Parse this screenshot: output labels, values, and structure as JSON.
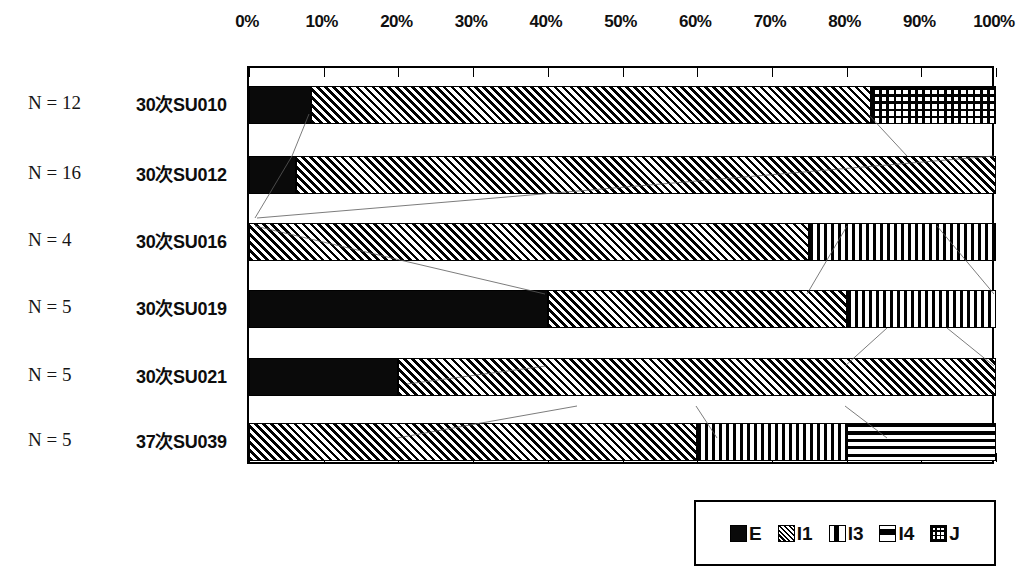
{
  "chart_data": {
    "type": "bar",
    "orientation": "horizontal",
    "stacked": true,
    "normalized_percent": true,
    "title": "",
    "xlabel": "",
    "ylabel": "",
    "xlim": [
      0,
      100
    ],
    "grid": false,
    "tick_labels": [
      "0%",
      "10%",
      "20%",
      "30%",
      "40%",
      "50%",
      "60%",
      "70%",
      "80%",
      "90%",
      "100%"
    ],
    "tick_values": [
      0,
      10,
      20,
      30,
      40,
      50,
      60,
      70,
      80,
      90,
      100
    ],
    "legend_position": "bottom-right",
    "categories": [
      "30次SU010",
      "30次SU012",
      "30次SU016",
      "30次SU019",
      "30次SU021",
      "37次SU039"
    ],
    "n_labels": [
      "N = 12",
      "N = 16",
      "N = 4",
      "N = 5",
      "N = 5",
      "N = 5"
    ],
    "series": [
      {
        "name": "E",
        "pattern": "solid-black",
        "values": [
          8.3,
          6.25,
          0,
          40,
          20,
          0
        ]
      },
      {
        "name": "I1",
        "pattern": "diagonal-hatch",
        "values": [
          75.0,
          93.75,
          75,
          40,
          80,
          60
        ]
      },
      {
        "name": "I3",
        "pattern": "vertical-stripes",
        "values": [
          0,
          0,
          25,
          20,
          0,
          20
        ]
      },
      {
        "name": "I4",
        "pattern": "horizontal-stripes",
        "values": [
          0,
          0,
          0,
          0,
          0,
          20
        ]
      },
      {
        "name": "J",
        "pattern": "grid-crosshatch",
        "values": [
          16.7,
          0,
          0,
          0,
          0,
          0
        ]
      }
    ],
    "legend": [
      {
        "label": "E",
        "pattern": "solid-black"
      },
      {
        "label": "I1",
        "pattern": "diagonal-hatch"
      },
      {
        "label": "I3",
        "pattern": "vertical-stripes"
      },
      {
        "label": "I4",
        "pattern": "horizontal-stripes"
      },
      {
        "label": "J",
        "pattern": "grid-crosshatch"
      }
    ]
  },
  "colors": {
    "ink": "#000000",
    "paper": "#ffffff"
  }
}
